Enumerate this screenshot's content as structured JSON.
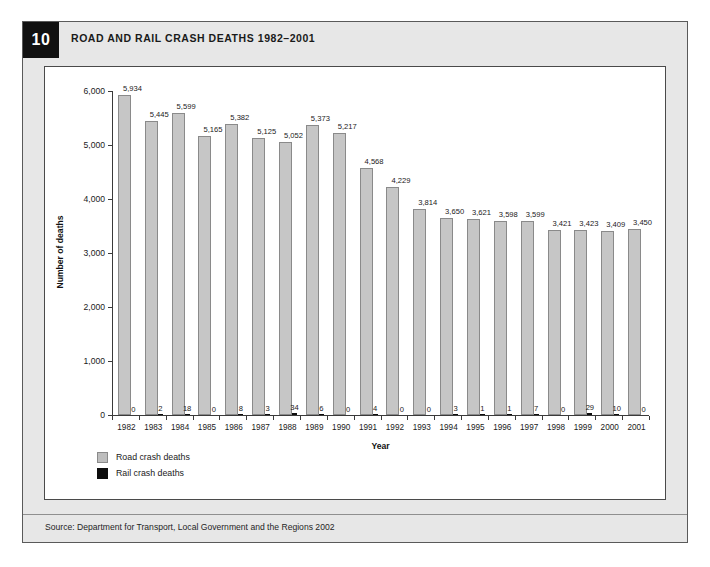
{
  "figure": {
    "number": "10",
    "title": "ROAD AND RAIL CRASH DEATHS 1982–2001",
    "source": "Source: Department for Transport, Local Government and the Regions 2002"
  },
  "legend": {
    "items": [
      {
        "label": "Road crash deaths",
        "color": "#bdbdbd"
      },
      {
        "label": "Rail crash deaths",
        "color": "#0d0d0d"
      }
    ]
  },
  "chart_data": {
    "type": "bar",
    "title": "ROAD AND RAIL CRASH DEATHS 1982–2001",
    "xlabel": "Year",
    "ylabel": "Number of deaths",
    "ylim": [
      0,
      6000
    ],
    "yticks": [
      0,
      1000,
      2000,
      3000,
      4000,
      5000,
      6000
    ],
    "ytick_labels": [
      "0",
      "1,000",
      "2,000",
      "3,000",
      "4,000",
      "5,000",
      "6,000"
    ],
    "grid": false,
    "legend_position": "bottom-left",
    "categories": [
      "1982",
      "1983",
      "1984",
      "1985",
      "1986",
      "1987",
      "1988",
      "1989",
      "1990",
      "1991",
      "1992",
      "1993",
      "1994",
      "1995",
      "1996",
      "1997",
      "1998",
      "1999",
      "2000",
      "2001"
    ],
    "series": [
      {
        "name": "Road crash deaths",
        "color": "#c6c6c6",
        "values": [
          5934,
          5445,
          5599,
          5165,
          5382,
          5125,
          5052,
          5373,
          5217,
          4568,
          4229,
          3814,
          3650,
          3621,
          3598,
          3599,
          3421,
          3423,
          3409,
          3450
        ],
        "labels": [
          "5,934",
          "5,445",
          "5,599",
          "5,165",
          "5,382",
          "5,125",
          "5,052",
          "5,373",
          "5,217",
          "4,568",
          "4,229",
          "3,814",
          "3,650",
          "3,621",
          "3,598",
          "3,599",
          "3,421",
          "3,423",
          "3,409",
          "3,450"
        ]
      },
      {
        "name": "Rail crash deaths",
        "color": "#0d0d0d",
        "values": [
          0,
          2,
          18,
          0,
          8,
          3,
          34,
          6,
          0,
          4,
          0,
          0,
          3,
          1,
          1,
          7,
          0,
          29,
          10,
          0
        ],
        "labels": [
          "0",
          "2",
          "18",
          "0",
          "8",
          "3",
          "34",
          "6",
          "0",
          "4",
          "0",
          "0",
          "3",
          "1",
          "1",
          "7",
          "0",
          "29",
          "10",
          "0"
        ]
      }
    ]
  }
}
